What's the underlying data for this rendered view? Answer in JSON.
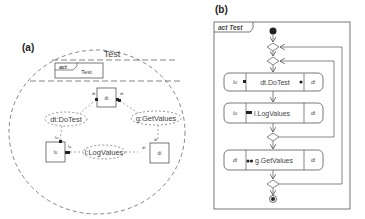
{
  "panel_a": {
    "label": "(a)",
    "collaboration_name": "Test",
    "activity_frame": {
      "keyword": "act",
      "name": "Test"
    },
    "parts": {
      "top": {
        "name": "dt",
        "port_left": "dt",
        "port_right": "dt"
      },
      "left": {
        "name": "lu",
        "port_top": "lu",
        "port_right": "lu"
      },
      "right": {
        "name": "dt",
        "port_top": "dt",
        "port_left": "dt"
      }
    },
    "roles": {
      "do_test": "dt:DoTest",
      "get_values": "g:GetValues",
      "log_values": "l:LogValues"
    }
  },
  "panel_b": {
    "label": "(b)",
    "frame_title": "act Test",
    "actions": [
      {
        "name": "dt.DoTest",
        "left_pin": "lu",
        "right_pin": "dt"
      },
      {
        "name": "l.LogValues",
        "left_pin": "lu",
        "right_pin": "dt"
      },
      {
        "name": "g.GetValues",
        "left_pin": "dt",
        "right_pin": "dt"
      }
    ]
  },
  "colors": {
    "line": "#555555",
    "fill": "#ffffff",
    "dark": "#222222"
  }
}
